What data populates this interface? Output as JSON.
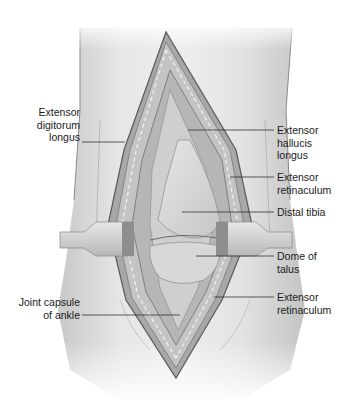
{
  "figure": {
    "labels_left": [
      {
        "id": "edl",
        "text": "Extensor\ndigitorum\nlongus"
      },
      {
        "id": "joint-capsule",
        "text": "Joint capsule\nof ankle"
      }
    ],
    "labels_right": [
      {
        "id": "ehl",
        "text": "Extensor\nhallucis\nlongus"
      },
      {
        "id": "ext-ret-upper",
        "text": "Extensor\nretinaculum"
      },
      {
        "id": "distal-tibia",
        "text": "Distal tibia"
      },
      {
        "id": "dome-talus",
        "text": "Dome of\ntalus"
      },
      {
        "id": "ext-ret-lower",
        "text": "Extensor\nretinaculum"
      }
    ],
    "colors": {
      "skin": "#e4e4e4",
      "skin_shadow": "#bdbdbd",
      "incision_edge": "#6f6f6f",
      "bone": "#d6d6d6",
      "retractor": "#cfcfcf",
      "leader_line": "#333333"
    }
  }
}
